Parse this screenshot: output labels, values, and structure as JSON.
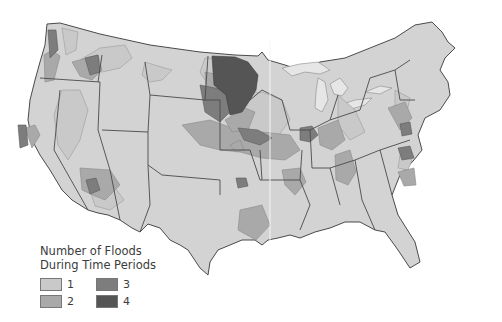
{
  "map": {
    "subject": "Contiguous United States flood frequency map",
    "legend": {
      "title_line1": "Number of Floods",
      "title_line2": "During Time Periods",
      "items": [
        {
          "value": "1",
          "color": "#c9c9c9"
        },
        {
          "value": "2",
          "color": "#a9a9a9"
        },
        {
          "value": "3",
          "color": "#7d7d7d"
        },
        {
          "value": "4",
          "color": "#555555"
        }
      ]
    },
    "colors": {
      "background": "#ffffff",
      "base_state": "#d3d3d3",
      "lakes": "#e6e6e6",
      "borders": "#4a4a4a"
    }
  }
}
